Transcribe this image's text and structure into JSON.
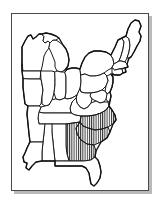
{
  "figure": {
    "kind": "outline-map",
    "region": "Eastern United States",
    "frame": {
      "visible": true,
      "border_color": "#4a4a4a",
      "shadow_color": "#b9b9b9",
      "background_color": "#ffffff"
    },
    "style": {
      "line_color": "#1a1a1a",
      "fill_color": "#ffffff",
      "hatch_pattern": "vertical-lines",
      "hatch_color": "#1a1a1a",
      "hatch_spacing_px": 2
    },
    "legend": {
      "visible": false,
      "entries": []
    },
    "labels": {
      "visible": false,
      "entries": []
    },
    "highlight": {
      "pattern": "vertical-hatching",
      "states": [
        "North Carolina",
        "South Carolina",
        "Georgia"
      ],
      "description": "Vertical hatching over the Carolinas and Georgia"
    },
    "states": [
      {
        "id": "maine",
        "name": "Maine",
        "highlighted": false
      },
      {
        "id": "new-hampshire",
        "name": "New Hampshire",
        "highlighted": false
      },
      {
        "id": "vermont",
        "name": "Vermont",
        "highlighted": false
      },
      {
        "id": "massachusetts",
        "name": "Massachusetts",
        "highlighted": false
      },
      {
        "id": "rhode-island",
        "name": "Rhode Island",
        "highlighted": false
      },
      {
        "id": "connecticut",
        "name": "Connecticut",
        "highlighted": false
      },
      {
        "id": "new-york",
        "name": "New York",
        "highlighted": false
      },
      {
        "id": "new-jersey",
        "name": "New Jersey",
        "highlighted": false
      },
      {
        "id": "pennsylvania",
        "name": "Pennsylvania",
        "highlighted": false
      },
      {
        "id": "delaware",
        "name": "Delaware",
        "highlighted": false
      },
      {
        "id": "maryland",
        "name": "Maryland",
        "highlighted": false
      },
      {
        "id": "west-virginia",
        "name": "West Virginia",
        "highlighted": false
      },
      {
        "id": "virginia",
        "name": "Virginia",
        "highlighted": false
      },
      {
        "id": "ohio",
        "name": "Ohio",
        "highlighted": false
      },
      {
        "id": "michigan",
        "name": "Michigan",
        "highlighted": false
      },
      {
        "id": "wisconsin",
        "name": "Wisconsin",
        "highlighted": false
      },
      {
        "id": "illinois",
        "name": "Illinois",
        "highlighted": false
      },
      {
        "id": "indiana",
        "name": "Indiana",
        "highlighted": false
      },
      {
        "id": "kentucky",
        "name": "Kentucky",
        "highlighted": false
      },
      {
        "id": "tennessee",
        "name": "Tennessee",
        "highlighted": false
      },
      {
        "id": "north-carolina",
        "name": "North Carolina",
        "highlighted": true
      },
      {
        "id": "south-carolina",
        "name": "South Carolina",
        "highlighted": true
      },
      {
        "id": "georgia",
        "name": "Georgia",
        "highlighted": true
      },
      {
        "id": "florida",
        "name": "Florida",
        "highlighted": false
      },
      {
        "id": "alabama",
        "name": "Alabama",
        "highlighted": false
      },
      {
        "id": "mississippi",
        "name": "Mississippi",
        "highlighted": false
      },
      {
        "id": "louisiana",
        "name": "Louisiana",
        "highlighted": false
      },
      {
        "id": "arkansas",
        "name": "Arkansas",
        "highlighted": false
      },
      {
        "id": "missouri",
        "name": "Missouri",
        "highlighted": false
      },
      {
        "id": "iowa",
        "name": "Iowa",
        "highlighted": false
      }
    ]
  }
}
